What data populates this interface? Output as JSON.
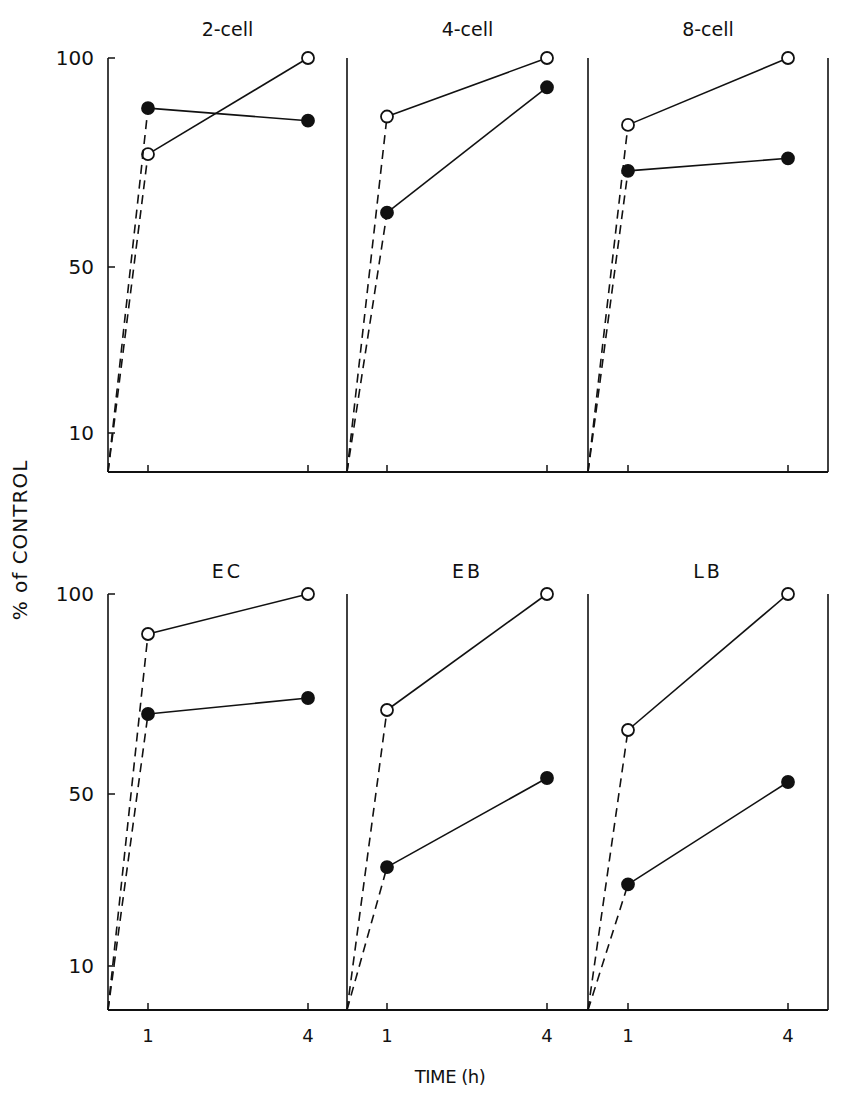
{
  "figure": {
    "ylabel": "% of CONTROL",
    "xlabel": "TIME (h)",
    "y_ticks": [
      "100",
      "50",
      "10"
    ],
    "x_ticks": [
      "1",
      "4"
    ],
    "colors": {
      "ink": "#111111",
      "background": "#ffffff"
    }
  },
  "chart_data": {
    "type": "line",
    "title": "",
    "xlabel": "TIME (h)",
    "ylabel": "% of CONTROL",
    "layout": "2x3 small multiples, shared y-axis per row",
    "y_ticks": [
      10,
      50,
      100
    ],
    "x_ticks": [
      1,
      4
    ],
    "ylim": [
      0,
      100
    ],
    "grid": false,
    "legend": "none (open circles vs filled circles series)",
    "panels": [
      {
        "name": "2-cell",
        "row": 0,
        "col": 0,
        "series": [
          {
            "name": "open",
            "marker": "open-circle",
            "x": [
              0,
              1,
              4
            ],
            "values": [
              0,
              77,
              100
            ]
          },
          {
            "name": "filled",
            "marker": "filled-circle",
            "x": [
              0,
              1,
              4
            ],
            "values": [
              0,
              88,
              85
            ]
          }
        ]
      },
      {
        "name": "4-cell",
        "row": 0,
        "col": 1,
        "series": [
          {
            "name": "open",
            "marker": "open-circle",
            "x": [
              0,
              1,
              4
            ],
            "values": [
              0,
              86,
              100
            ]
          },
          {
            "name": "filled",
            "marker": "filled-circle",
            "x": [
              0,
              1,
              4
            ],
            "values": [
              0,
              63,
              93
            ]
          }
        ]
      },
      {
        "name": "8-cell",
        "row": 0,
        "col": 2,
        "series": [
          {
            "name": "open",
            "marker": "open-circle",
            "x": [
              0,
              1,
              4
            ],
            "values": [
              0,
              84,
              100
            ]
          },
          {
            "name": "filled",
            "marker": "filled-circle",
            "x": [
              0,
              1,
              4
            ],
            "values": [
              0,
              73,
              76
            ]
          }
        ]
      },
      {
        "name": "EC",
        "row": 1,
        "col": 0,
        "series": [
          {
            "name": "open",
            "marker": "open-circle",
            "x": [
              0,
              1,
              4
            ],
            "values": [
              0,
              90,
              100
            ]
          },
          {
            "name": "filled",
            "marker": "filled-circle",
            "x": [
              0,
              1,
              4
            ],
            "values": [
              0,
              70,
              74
            ]
          }
        ]
      },
      {
        "name": "EB",
        "row": 1,
        "col": 1,
        "series": [
          {
            "name": "open",
            "marker": "open-circle",
            "x": [
              0,
              1,
              4
            ],
            "values": [
              0,
              71,
              100
            ]
          },
          {
            "name": "filled",
            "marker": "filled-circle",
            "x": [
              0,
              1,
              4
            ],
            "values": [
              0,
              33,
              54
            ]
          }
        ]
      },
      {
        "name": "LB",
        "row": 1,
        "col": 2,
        "series": [
          {
            "name": "open",
            "marker": "open-circle",
            "x": [
              0,
              1,
              4
            ],
            "values": [
              0,
              66,
              100
            ]
          },
          {
            "name": "filled",
            "marker": "filled-circle",
            "x": [
              0,
              1,
              4
            ],
            "values": [
              0,
              29,
              53
            ]
          }
        ]
      }
    ]
  }
}
